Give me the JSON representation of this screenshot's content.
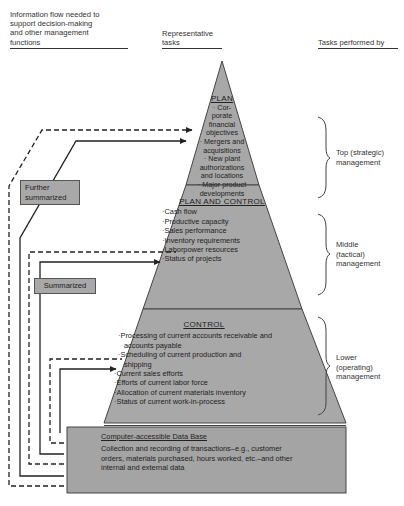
{
  "headers": {
    "info_flow": "Information flow needed to support decision-making and other management functions",
    "info_flow_lines": [
      "Information flow needed to",
      "support decision-making",
      "and other management",
      "functions"
    ],
    "representative_tasks_lines": [
      "Representative",
      "tasks"
    ],
    "tasks_performed_by": "Tasks performed by"
  },
  "pyramid": {
    "plan": {
      "title": "PLAN",
      "items": [
        "Cor-",
        "porate",
        "financial",
        "objectives",
        "Mergers and",
        "acquisitions",
        "New plant",
        "authorizations",
        "and locations",
        "Major product",
        "developments"
      ],
      "lines": [
        {
          "bullet": true,
          "text": "Cor-"
        },
        {
          "bullet": false,
          "text": "porate"
        },
        {
          "bullet": false,
          "text": "financial"
        },
        {
          "bullet": false,
          "text": "objectives"
        },
        {
          "bullet": true,
          "text": "Mergers and"
        },
        {
          "bullet": false,
          "text": "acquisitions"
        },
        {
          "bullet": true,
          "text": "New plant"
        },
        {
          "bullet": false,
          "text": "authorizations"
        },
        {
          "bullet": false,
          "text": "and locations"
        },
        {
          "bullet": true,
          "text": "Major product"
        },
        {
          "bullet": false,
          "text": "developments"
        }
      ]
    },
    "plan_and_control": {
      "title": "PLAN AND CONTROL",
      "items": [
        "Cash flow",
        "Productive capacity",
        "Sales performance",
        "Inventory requirements",
        "Laborpower resources",
        "Status of projects"
      ]
    },
    "control": {
      "title": "CONTROL",
      "items": [
        "Processing of current accounts receivable and accounts payable",
        "Scheduling of current production and shipping",
        "Current sales efforts",
        "Efforts of current labor force",
        "Allocation of current materials inventory",
        "Status of current work-in-process"
      ]
    },
    "database": {
      "title": "Computer-accessible Data Base",
      "text": "Collection and recording of transactions–e.g., customer orders, materials purchased, hours worked, etc.–and other internal and external data"
    }
  },
  "flow_labels": {
    "further_summarized": "Further summarized",
    "summarized": "Summarized"
  },
  "management_levels": [
    {
      "label": "Top (strategic) management",
      "lines": [
        "Top (strategic)",
        "management"
      ]
    },
    {
      "label": "Middle (tactical) management",
      "lines": [
        "Middle",
        "(tactical)",
        "management"
      ]
    },
    {
      "label": "Lower (operating) management",
      "lines": [
        "Lower",
        "(operating)",
        "management"
      ]
    }
  ],
  "colors": {
    "pyramid_fill": "#a8a8a8",
    "database_fill": "#a4a4a4",
    "outline": "#444444",
    "label_box_fill": "#a8a8a8"
  }
}
